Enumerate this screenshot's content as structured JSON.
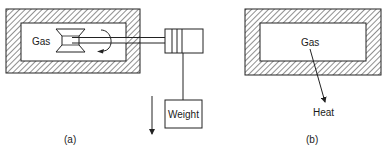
{
  "diagram": {
    "colors": {
      "stroke": "#222222",
      "hatch": "#333333",
      "background": "#ffffff"
    },
    "panel_a": {
      "caption": "(a)",
      "gas_label": "Gas",
      "weight_label": "Weight",
      "elements": [
        "insulated-container",
        "paddle-wheel",
        "rotation-arrow",
        "shaft",
        "pulley-drum",
        "rope",
        "weight",
        "downward-arrow"
      ]
    },
    "panel_b": {
      "caption": "(b)",
      "gas_label": "Gas",
      "heat_label": "Heat",
      "elements": [
        "insulated-container",
        "heat-arrow"
      ]
    }
  }
}
